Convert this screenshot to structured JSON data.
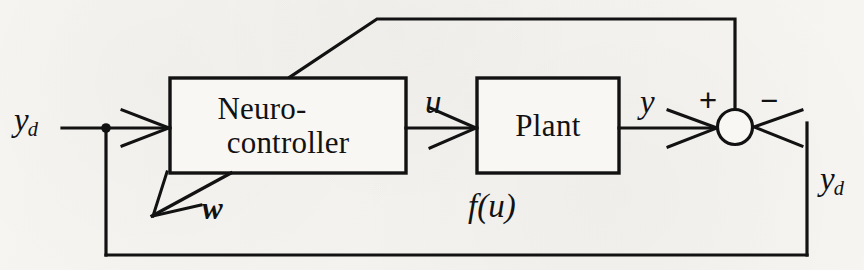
{
  "diagram": {
    "background_color": "#f6f5f2",
    "line_color": "#121212",
    "blocks": [
      {
        "id": "neuro_controller",
        "line_1": "Neuro-",
        "line_2": "controller",
        "x": 170,
        "y": 78,
        "width": 236,
        "height": 95
      },
      {
        "id": "plant",
        "line_1": "Plant",
        "line_2": "",
        "x": 477,
        "y": 78,
        "width": 142,
        "height": 95
      }
    ],
    "labels": {
      "reference_input": {
        "base": "y",
        "subscript": "d"
      },
      "control_signal": "u",
      "plant_output": "y",
      "weights": "w",
      "plant_function": "f(u)",
      "feedback_input": {
        "base": "y",
        "subscript": "d"
      },
      "sum_positive": "+",
      "sum_negative": "−"
    },
    "summing_junction": {
      "cx": 735,
      "cy": 127,
      "r": 17
    },
    "junction_dot": {
      "cx": 106,
      "cy": 128,
      "r": 4.5
    }
  }
}
